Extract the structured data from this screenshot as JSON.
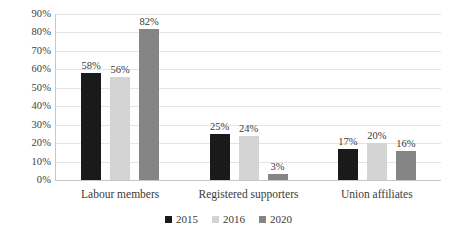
{
  "chart_data": {
    "type": "bar",
    "title": "",
    "subtitle": "",
    "xlabel": "",
    "ylabel": "",
    "ylim": [
      0,
      90
    ],
    "ytick_step": 10,
    "ytick_labels": [
      "0%",
      "10%",
      "20%",
      "30%",
      "40%",
      "50%",
      "60%",
      "70%",
      "80%",
      "90%"
    ],
    "grid": true,
    "legend_position": "bottom",
    "value_labels": true,
    "value_label_suffix": "%",
    "categories": [
      "Labour members",
      "Registered supporters",
      "Union affiliates"
    ],
    "series": [
      {
        "name": "2015",
        "color": "#1a1a1a",
        "values": [
          58,
          25,
          17
        ],
        "labels": [
          "58%",
          "25%",
          "17%"
        ]
      },
      {
        "name": "2016",
        "color": "#d4d4d4",
        "values": [
          56,
          24,
          20
        ],
        "labels": [
          "56%",
          "24%",
          "20%"
        ]
      },
      {
        "name": "2020",
        "color": "#858585",
        "values": [
          82,
          3,
          16
        ],
        "labels": [
          "82%",
          "3%",
          "16%"
        ]
      }
    ]
  },
  "legend": {
    "items": [
      {
        "label": "2015",
        "color": "#1a1a1a"
      },
      {
        "label": "2016",
        "color": "#d4d4d4"
      },
      {
        "label": "2020",
        "color": "#858585"
      }
    ]
  },
  "colors": {
    "background": "#ffffff",
    "gridline": "#e4e4e4",
    "axis": "#c8c8c8",
    "text": "#3a3a3a",
    "series_2015": "#1a1a1a",
    "series_2016": "#d4d4d4",
    "series_2020": "#858585"
  }
}
